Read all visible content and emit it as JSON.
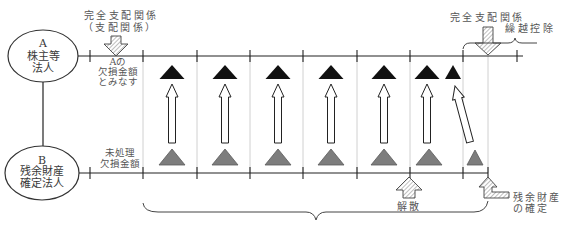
{
  "diagram": {
    "entity_a": {
      "label": "A",
      "line1": "株主等",
      "line2": "法人"
    },
    "entity_b": {
      "label": "B",
      "line1": "残余財産",
      "line2": "確定法人"
    },
    "top_left_event": {
      "line1": "完全支配関係",
      "line2": "（支配関係）"
    },
    "row_a_label": {
      "line1": "Aの",
      "line2": "欠損金額",
      "line3": "とみなす"
    },
    "row_b_label": {
      "line1": "未処理",
      "line2": "欠損金額"
    },
    "top_right_event": {
      "line1": "完全支配関係",
      "line2": "繰越控除"
    },
    "dissolution": "解散",
    "residual_assets_fixed": {
      "line1": "残余財産",
      "line2": "の確定"
    },
    "deemed_loss_markers": 7,
    "unprocessed_loss_markers": 7
  },
  "colors": {
    "deemed_loss_triangle": "#111111",
    "unprocessed_loss_triangle": "#7d7d7d",
    "gridline": "#c4c4c4",
    "axis": "#222222",
    "hatch": "#888888"
  }
}
